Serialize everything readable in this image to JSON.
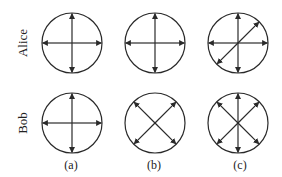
{
  "diagram": {
    "rows": [
      {
        "label": "Alice",
        "cy": 43
      },
      {
        "label": "Bob",
        "cy": 123
      }
    ],
    "columns": [
      {
        "label": "(a)",
        "cx": 72
      },
      {
        "label": "(b)",
        "cx": 155
      },
      {
        "label": "(c)",
        "cx": 238
      }
    ],
    "radius": 30,
    "arrow_sets": {
      "Alice": {
        "(a)": [
          "horizontal",
          "vertical"
        ],
        "(b)": [
          "horizontal",
          "vertical"
        ],
        "(c)": [
          "horizontal",
          "vertical",
          "diagonal-ne-sw"
        ]
      },
      "Bob": {
        "(a)": [
          "horizontal",
          "vertical"
        ],
        "(b)": [
          "diagonal-ne-sw",
          "diagonal-nw-se"
        ],
        "(c)": [
          "vertical",
          "diagonal-ne-sw",
          "diagonal-nw-se"
        ]
      }
    },
    "stroke_color": "#2a2a2a"
  }
}
